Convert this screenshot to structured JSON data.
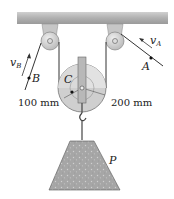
{
  "diagram": {
    "type": "pulley-system",
    "points": {
      "A": {
        "label": "A",
        "velocity_label": "v",
        "velocity_sub": "A"
      },
      "B": {
        "label": "B",
        "velocity_label": "v",
        "velocity_sub": "B"
      },
      "C": {
        "label": "C"
      }
    },
    "dimensions": {
      "inner_radius": "100 mm",
      "outer_radius": "200 mm"
    },
    "load": {
      "label": "P"
    },
    "colors": {
      "ceiling": "#b5b5b5",
      "bracket": "#c8c8c8",
      "pulley_face": "#d9d9d9",
      "pulley_shade": "#bdbdbd",
      "load_fill": "#a9a9a9",
      "rope": "#333333"
    }
  }
}
